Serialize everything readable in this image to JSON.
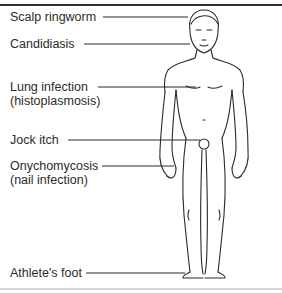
{
  "diagram": {
    "title_fragment": "g",
    "labels": [
      {
        "id": "scalp-ringworm",
        "line1": "Scalp ringworm",
        "line2": ""
      },
      {
        "id": "candidiasis",
        "line1": "Candidiasis",
        "line2": ""
      },
      {
        "id": "lung-infection",
        "line1": "Lung infection",
        "line2": "(histoplasmosis)"
      },
      {
        "id": "jock-itch",
        "line1": "Jock itch",
        "line2": ""
      },
      {
        "id": "onychomycosis",
        "line1": "Onychomycosis",
        "line2": "(nail infection)"
      },
      {
        "id": "athletes-foot",
        "line1": "Athlete's foot",
        "line2": ""
      }
    ],
    "colors": {
      "line": "#2a2a2a",
      "text": "#2b2b2b",
      "background": "#ffffff"
    }
  }
}
